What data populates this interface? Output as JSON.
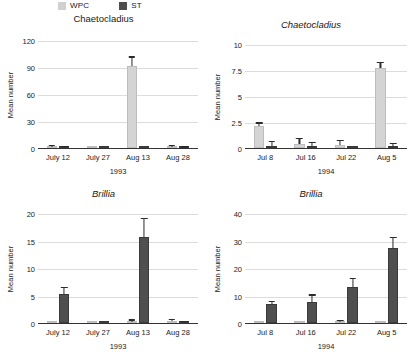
{
  "legend": {
    "entries": [
      {
        "label": "WPC",
        "color": "#d4d4d4",
        "icon": "legend-swatch-wpc"
      },
      {
        "label": "ST",
        "color": "#4f4f4f",
        "icon": "legend-swatch-st"
      }
    ]
  },
  "ylabel_text": "Mean number",
  "chart_data": [
    {
      "id": "chaetocladius-1993",
      "type": "bar",
      "title": "Chaetocladius",
      "title_italic": false,
      "xlabel": "1993",
      "ylabel": "Mean number",
      "categories": [
        "July 12",
        "July 27",
        "Aug 13",
        "Aug 28"
      ],
      "ylim": [
        0,
        120
      ],
      "yticks": [
        0,
        30,
        60,
        90,
        120
      ],
      "ytick_labels": [
        "0",
        "30",
        "60",
        "90",
        "120"
      ],
      "grid": true,
      "legend_position": "top",
      "series": [
        {
          "name": "WPC",
          "color": "#d4d4d4",
          "values": [
            1.5,
            0,
            91,
            1.2
          ],
          "errors": [
            0.6,
            0,
            9.5,
            0.5
          ]
        },
        {
          "name": "ST",
          "color": "#4f4f4f",
          "values": [
            0.4,
            0,
            0,
            0.3
          ],
          "errors": [
            0.2,
            0,
            0,
            0.2
          ]
        }
      ]
    },
    {
      "id": "chaetocladius-1994",
      "type": "bar",
      "title": "Chaetocladius",
      "title_italic": true,
      "xlabel": "1994",
      "ylabel": "Mean number",
      "categories": [
        "Jul 8",
        "Jul 16",
        "Jul 22",
        "Aug 5"
      ],
      "ylim": [
        0,
        10
      ],
      "yticks": [
        0,
        2.5,
        5,
        7.5,
        10
      ],
      "ytick_labels": [
        "0",
        "2.5",
        "5",
        "7.5",
        "10"
      ],
      "grid": true,
      "legend_position": "top",
      "series": [
        {
          "name": "WPC",
          "color": "#d4d4d4",
          "values": [
            2.15,
            0.35,
            0.3,
            7.7
          ],
          "errors": [
            0.2,
            0.5,
            0.35,
            0.5
          ]
        },
        {
          "name": "ST",
          "color": "#4f4f4f",
          "values": [
            0.15,
            0.1,
            0,
            0.1
          ],
          "errors": [
            0.45,
            0.4,
            0,
            0.3
          ]
        }
      ]
    },
    {
      "id": "brillia-1993",
      "type": "bar",
      "title": "Brillia",
      "title_italic": true,
      "xlabel": "1993",
      "ylabel": "Mean number",
      "categories": [
        "July 12",
        "July 27",
        "Aug 13",
        "Aug 28"
      ],
      "ylim": [
        0,
        20
      ],
      "yticks": [
        0,
        5,
        10,
        15,
        20
      ],
      "ytick_labels": [
        "0",
        "5",
        "10",
        "15",
        "20"
      ],
      "grid": true,
      "legend_position": "top",
      "series": [
        {
          "name": "WPC",
          "color": "#d4d4d4",
          "values": [
            0,
            0,
            0.25,
            0.3
          ],
          "errors": [
            0,
            0,
            0.2,
            0.2
          ]
        },
        {
          "name": "ST",
          "color": "#4f4f4f",
          "values": [
            5.3,
            0,
            15.6,
            0.15
          ],
          "errors": [
            1.1,
            0,
            3.3,
            0.1
          ]
        }
      ]
    },
    {
      "id": "brillia-1994",
      "type": "bar",
      "title": "Brillia",
      "title_italic": true,
      "xlabel": "1994",
      "ylabel": "Mean number",
      "categories": [
        "Jul 8",
        "Jul 16",
        "Jul 22",
        "Aug 5"
      ],
      "ylim": [
        0,
        40
      ],
      "yticks": [
        0,
        10,
        20,
        30,
        40
      ],
      "ytick_labels": [
        "0",
        "10",
        "20",
        "30",
        "40"
      ],
      "grid": true,
      "legend_position": "top",
      "series": [
        {
          "name": "WPC",
          "color": "#d4d4d4",
          "values": [
            0,
            0,
            0.5,
            0
          ],
          "errors": [
            0,
            0,
            0.3,
            0
          ]
        },
        {
          "name": "ST",
          "color": "#4f4f4f",
          "values": [
            6.8,
            7.7,
            13.0,
            27.2
          ],
          "errors": [
            0.9,
            2.3,
            3.0,
            3.6
          ]
        }
      ]
    }
  ]
}
